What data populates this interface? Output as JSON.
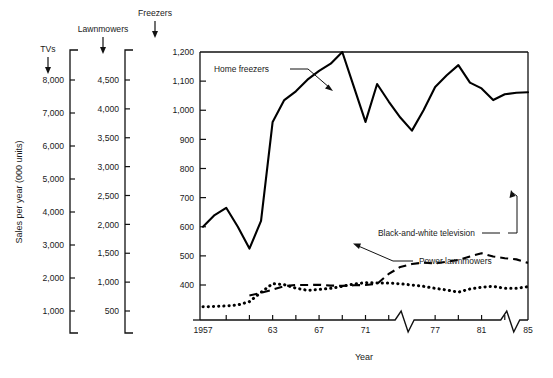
{
  "figure": {
    "y_axis_title": "Sales per year (000 units)",
    "x_axis_title": "Year"
  },
  "axes_headers": [
    {
      "name": "tvs",
      "label": "TVs"
    },
    {
      "name": "lawnmowers",
      "label": "Lawnmowers"
    },
    {
      "name": "freezers",
      "label": "Freezers"
    }
  ],
  "scales": {
    "tvs": {
      "label": "TVs",
      "ticks": [
        "8,000",
        "7,000",
        "6,000",
        "5,000",
        "4,000",
        "3,000",
        "2,000",
        "1,000"
      ],
      "values": [
        8000,
        7000,
        6000,
        5000,
        4000,
        3000,
        2000,
        1000
      ],
      "min": 1000,
      "max": 8000
    },
    "lawnmowers": {
      "label": "Lawnmowers",
      "ticks": [
        "4,500",
        "4,000",
        "3,500",
        "3,000",
        "2,500",
        "2,000",
        "1,500",
        "1,000",
        "500"
      ],
      "values": [
        4500,
        4000,
        3500,
        3000,
        2500,
        2000,
        1500,
        1000,
        500
      ],
      "min": 500,
      "max": 4500
    },
    "freezers": {
      "label": "Freezers",
      "ticks": [
        "1,200",
        "1,100",
        "1,000",
        "900",
        "800",
        "700",
        "600",
        "500",
        "400"
      ],
      "values": [
        1200,
        1100,
        1000,
        900,
        800,
        700,
        600,
        500,
        400
      ],
      "min": 400,
      "max": 1200
    }
  },
  "x_axis": {
    "tick_labels": [
      "1957",
      "63",
      "67",
      "71",
      "77",
      "81",
      "85"
    ],
    "tick_years": [
      1957,
      1963,
      1967,
      1971,
      1977,
      1981,
      1985
    ],
    "minor_years": [
      1959,
      1961,
      1965,
      1969,
      1973,
      1979,
      1983
    ],
    "range": [
      1957,
      1985
    ],
    "breaks": [
      1974.5,
      1983.6
    ]
  },
  "series_labels": [
    {
      "name": "home-freezers",
      "label": "Home freezers"
    },
    {
      "name": "black-and-white-television",
      "label": "Black-and-white television"
    },
    {
      "name": "power-lawnmowers",
      "label": "Power lawnmowers"
    }
  ],
  "chart_data": {
    "type": "line",
    "title": "",
    "xlabel": "Year",
    "ylabel": "Sales per year (000 units)",
    "xlim": [
      1957,
      1985
    ],
    "grid": false,
    "legend": "inline-annotations",
    "note": "Three series each plotted against its own vertical scale: freezers 400-1,200; lawnmowers 500-4,500; TVs 1,000-8,000 (000 units). Values below are read on the freezers (right-hand) scale in 000 units.",
    "x": [
      1957,
      1958,
      1959,
      1960,
      1961,
      1962,
      1963,
      1964,
      1965,
      1966,
      1967,
      1968,
      1969,
      1970,
      1971,
      1972,
      1973,
      1974,
      1975,
      1976,
      1977,
      1978,
      1979,
      1980,
      1981,
      1982,
      1983,
      1984,
      1985
    ],
    "series": [
      {
        "name": "Home freezers",
        "scale": "freezers",
        "style": "solid",
        "values": [
          600,
          640,
          665,
          600,
          525,
          620,
          960,
          1035,
          1065,
          1105,
          1135,
          1160,
          1200,
          1080,
          960,
          1090,
          1030,
          975,
          930,
          1000,
          1080,
          1120,
          1155,
          1095,
          1075,
          1035,
          1055,
          1060,
          1062
        ]
      },
      {
        "name": "Black-and-white television",
        "scale": "tvs",
        "style": "dotted",
        "values": [
          345,
          355,
          370,
          400,
          500,
          780,
          1040,
          1010,
          905,
          840,
          865,
          900,
          960,
          1030,
          1070,
          1060,
          1060,
          1035,
          1000,
          960,
          900,
          850,
          785,
          880,
          935,
          960,
          900,
          900,
          950
        ]
      },
      {
        "name": "Power lawnmowers",
        "scale": "lawnmowers",
        "style": "dashed",
        "values": [
          null,
          null,
          null,
          null,
          320,
          365,
          420,
          480,
          500,
          500,
          505,
          490,
          485,
          495,
          500,
          520,
          690,
          810,
          860,
          885,
          870,
          900,
          930,
          990,
          1045,
          990,
          960,
          940,
          880
        ]
      }
    ]
  }
}
